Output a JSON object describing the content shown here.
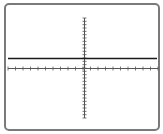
{
  "display": {
    "type": "oscilloscope-screen",
    "frame_color": "#7a7a7a",
    "axis_color": "#555555",
    "trace_color": "#1a1a1a",
    "horizontal_divisions": 20,
    "vertical_divisions": 30
  },
  "chart_data": {
    "type": "line",
    "title": "",
    "xlabel": "",
    "ylabel": "",
    "x": [
      -10,
      10
    ],
    "series": [
      {
        "name": "trace",
        "values": [
          3,
          3
        ]
      }
    ],
    "xlim": [
      -10,
      10
    ],
    "ylim": [
      -15,
      15
    ],
    "grid": false
  }
}
